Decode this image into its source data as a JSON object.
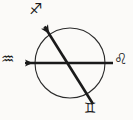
{
  "figure": {
    "name": "astrological-axis-diagram",
    "background_color": "#fbfaf8",
    "ink_color": "#1a1a1a",
    "circle": {
      "center_x": 70,
      "center_y": 63,
      "radius": 35,
      "stroke_width": 1.1
    },
    "axes": [
      {
        "id": "aquarius-leo-axis",
        "label": "horizontal axis",
        "start_x": 113,
        "start_y": 63,
        "end_x": 22,
        "end_y": 63,
        "stroke_width": 2.6,
        "arrowhead": "end"
      },
      {
        "id": "sagittarius-gemini-axis",
        "label": "diagonal axis",
        "start_x": 93,
        "start_y": 104,
        "end_x": 42,
        "end_y": 23,
        "stroke_width": 2.6,
        "arrowhead": "end"
      }
    ],
    "glyphs": [
      {
        "id": "sagittarius",
        "name": "sagittarius-glyph",
        "symbol": "♐",
        "position": "top",
        "x": 36,
        "y": 9
      },
      {
        "id": "aquarius",
        "name": "aquarius-glyph",
        "symbol": "♒",
        "position": "left",
        "x": 8,
        "y": 60
      },
      {
        "id": "leo",
        "name": "leo-glyph",
        "symbol": "♌",
        "position": "right",
        "x": 121,
        "y": 60
      },
      {
        "id": "gemini",
        "name": "gemini-glyph",
        "symbol": "♊",
        "position": "bottom",
        "x": 90,
        "y": 108
      }
    ]
  }
}
